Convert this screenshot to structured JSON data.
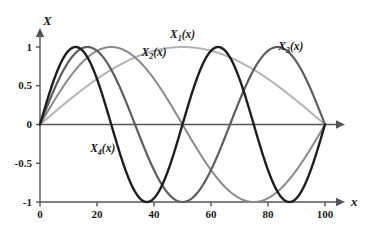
{
  "chart_data": {
    "type": "line",
    "title": "",
    "xlabel": "x",
    "ylabel": "X",
    "xlim": [
      0,
      105
    ],
    "ylim": [
      -1.15,
      1.15
    ],
    "grid": false,
    "legend_position": "inline-annotations",
    "x_ticks": [
      "0",
      "20",
      "40",
      "60",
      "80",
      "100"
    ],
    "x_tick_values": [
      0,
      20,
      40,
      60,
      80,
      100
    ],
    "y_ticks": [
      "1",
      "0.5",
      "0",
      "-0.5",
      "-1"
    ],
    "y_tick_values": [
      1,
      0.5,
      0,
      -0.5,
      -1
    ],
    "series": [
      {
        "name": "X1(x)",
        "label": "X",
        "subscript": "1",
        "suffix": "(x)",
        "mode_number": 1,
        "formula": "sin(1*pi*x/100)",
        "color": "#b4b4b4",
        "stroke_width": 2.0,
        "peaks": [
          {
            "x": 50,
            "y": 1
          }
        ],
        "troughs": [],
        "zeros": [
          0,
          100
        ],
        "label_pos": {
          "x": 50,
          "y": 1.12
        }
      },
      {
        "name": "X2(x)",
        "label": "X",
        "subscript": "2",
        "suffix": "(x)",
        "mode_number": 2,
        "formula": "sin(2*pi*x/100)",
        "color": "#8a8a8a",
        "stroke_width": 2.0,
        "peaks": [
          {
            "x": 25,
            "y": 1
          }
        ],
        "troughs": [
          {
            "x": 75,
            "y": -1
          }
        ],
        "zeros": [
          0,
          50,
          100
        ],
        "label_pos": {
          "x": 40,
          "y": 0.88
        }
      },
      {
        "name": "X3(x)",
        "label": "X",
        "subscript": "3",
        "suffix": "(x)",
        "mode_number": 3,
        "formula": "sin(3*pi*x/100)",
        "color": "#5e5e5e",
        "stroke_width": 2.2,
        "peaks": [
          {
            "x": 16.7,
            "y": 1
          },
          {
            "x": 83.3,
            "y": 1
          }
        ],
        "troughs": [
          {
            "x": 50,
            "y": -1
          }
        ],
        "zeros": [
          0,
          33.3,
          66.7,
          100
        ],
        "label_pos": {
          "x": 88,
          "y": 0.96
        }
      },
      {
        "name": "X4(x)",
        "label": "X",
        "subscript": "4",
        "suffix": "(x)",
        "mode_number": 4,
        "formula": "sin(4*pi*x/100)",
        "color": "#1f1f1f",
        "stroke_width": 2.4,
        "peaks": [
          {
            "x": 12.5,
            "y": 1
          },
          {
            "x": 62.5,
            "y": 1
          }
        ],
        "troughs": [
          {
            "x": 37.5,
            "y": -1
          },
          {
            "x": 87.5,
            "y": -1
          }
        ],
        "zeros": [
          0,
          25,
          50,
          75,
          100
        ],
        "label_pos": {
          "x": 22,
          "y": -0.35
        }
      }
    ],
    "axis_colors": {
      "axis": "#555555",
      "text": "#1a1a1a"
    },
    "background": "#ffffff"
  }
}
